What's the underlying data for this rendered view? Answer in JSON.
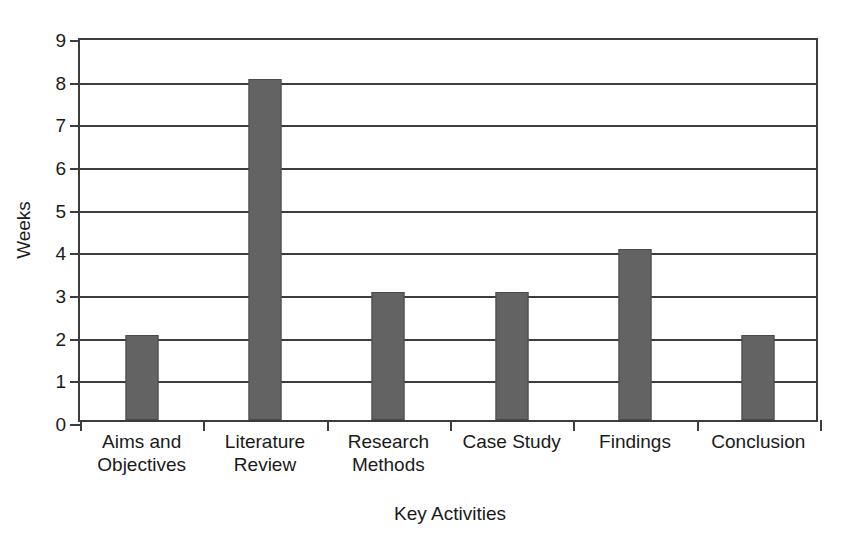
{
  "chart_data": {
    "type": "bar",
    "title": "",
    "xlabel": "Key Activities",
    "ylabel": "Weeks",
    "categories": [
      "Aims and Objectives",
      "Literature Review",
      "Research Methods",
      "Case Study",
      "Findings",
      "Conclusion"
    ],
    "category_lines": [
      [
        "Aims and",
        "Objectives"
      ],
      [
        "Literature",
        "Review"
      ],
      [
        "Research",
        "Methods"
      ],
      [
        "Case Study"
      ],
      [
        "Findings"
      ],
      [
        "Conclusion"
      ]
    ],
    "values": [
      2,
      8,
      3,
      3,
      4,
      2
    ],
    "ylim": [
      0,
      9
    ],
    "ytick_labels": [
      "0",
      "1",
      "2",
      "3",
      "4",
      "5",
      "6",
      "7",
      "8",
      "9"
    ],
    "ytick_values": [
      0,
      1,
      2,
      3,
      4,
      5,
      6,
      7,
      8,
      9
    ],
    "grid": true,
    "grid_axis": "y",
    "legend": false,
    "legend_position": "none",
    "colors": {
      "bar_fill": "#636363",
      "bar_border": "#4a4a4a",
      "gridline": "#3d3d3d",
      "axis": "#3d3d3d",
      "text": "#1a1a1a",
      "background": "#ffffff"
    }
  }
}
